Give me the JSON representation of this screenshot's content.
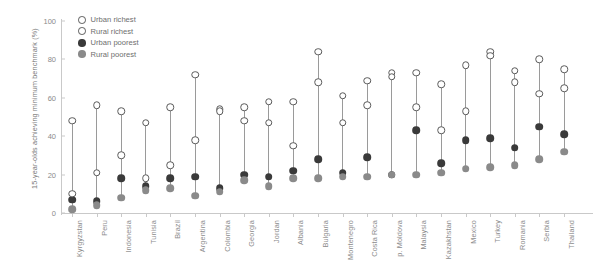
{
  "chart_data": {
    "type": "scatter",
    "title": "",
    "xlabel": "",
    "ylabel": "15-year-olds achieving minimum benchmark (%)",
    "ylim": [
      0,
      100
    ],
    "yticks": [
      0,
      20,
      40,
      60,
      80,
      100
    ],
    "grid": false,
    "legend_position": "top-left",
    "categories": [
      "Kyrgyzstan",
      "Peru",
      "Indonesia",
      "Tunisia",
      "Brazil",
      "Argentina",
      "Colombia",
      "Georgia",
      "Jordan",
      "Albania",
      "Bulgaria",
      "Montenegro",
      "Costa Rica",
      "p. Moldova",
      "Malaysia",
      "Kazakhstan",
      "Mexico",
      "Turkey",
      "Romania",
      "Serbia",
      "Thailand"
    ],
    "series": [
      {
        "name": "Urban richest",
        "marker": "open-circle",
        "color": "#5a5a5a",
        "values": [
          48,
          56,
          53,
          47,
          55,
          72,
          54,
          55,
          58,
          58,
          84,
          61,
          69,
          73,
          73,
          67,
          77,
          84,
          74,
          80,
          75
        ]
      },
      {
        "name": "Rural richest",
        "marker": "open-circle",
        "color": "#5a5a5a",
        "values": [
          10,
          21,
          30,
          18,
          25,
          38,
          53,
          48,
          47,
          35,
          68,
          47,
          56,
          71,
          55,
          43,
          53,
          82,
          68,
          62,
          65
        ]
      },
      {
        "name": "Urban poorest",
        "marker": "filled-dark",
        "color": "#3a3a3a",
        "values": [
          7,
          6,
          18,
          14,
          18,
          19,
          13,
          20,
          19,
          22,
          28,
          21,
          29,
          20,
          43,
          26,
          38,
          39,
          34,
          45,
          41
        ]
      },
      {
        "name": "Rural poorest",
        "marker": "filled-mid",
        "color": "#8a8a8a",
        "values": [
          2,
          4,
          8,
          12,
          13,
          9,
          11,
          17,
          14,
          18,
          18,
          19,
          19,
          20,
          20,
          21,
          23,
          24,
          25,
          28,
          32
        ]
      }
    ]
  },
  "legend": {
    "items": [
      {
        "label": "Urban richest",
        "style": "sw-open"
      },
      {
        "label": "Rural richest",
        "style": "sw-open"
      },
      {
        "label": "Urban poorest",
        "style": "sw-dark"
      },
      {
        "label": "Rural poorest",
        "style": "sw-mid"
      }
    ]
  }
}
